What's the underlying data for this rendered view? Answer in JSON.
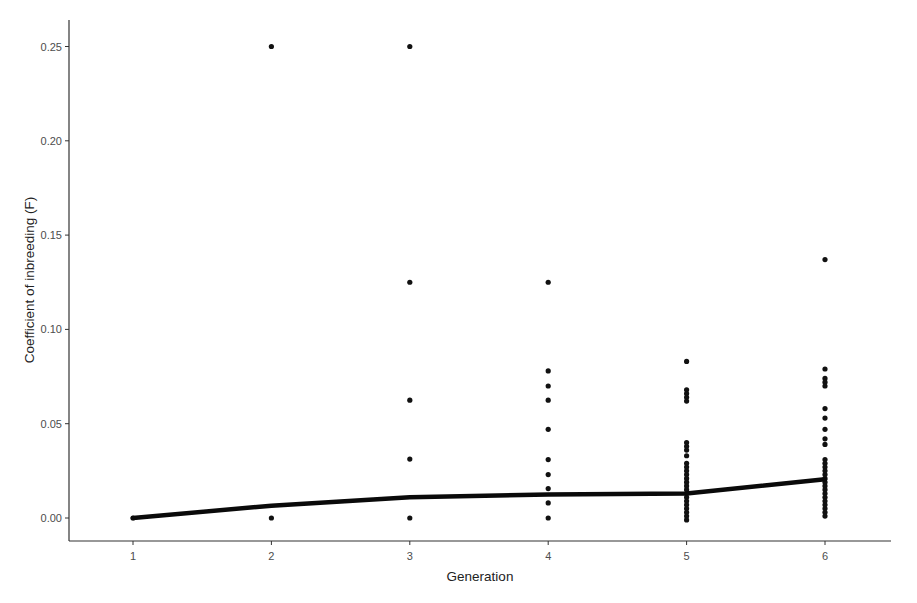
{
  "chart_data": {
    "type": "scatter",
    "title": "",
    "xlabel": "Generation",
    "ylabel": "Coefficient of inbreeding (F)",
    "x_ticks": [
      "1",
      "2",
      "3",
      "4",
      "5",
      "6"
    ],
    "y_ticks": [
      "0.00",
      "0.05",
      "0.10",
      "0.15",
      "0.20",
      "0.25"
    ],
    "xlim": [
      0.55,
      6.5
    ],
    "ylim": [
      -0.012,
      0.263
    ],
    "grid": false,
    "legend": null,
    "series": [
      {
        "name": "individuals",
        "kind": "points",
        "points": [
          {
            "x": 1,
            "y": 0.0
          },
          {
            "x": 2,
            "y": 0.25
          },
          {
            "x": 2,
            "y": 0.0
          },
          {
            "x": 3,
            "y": 0.25
          },
          {
            "x": 3,
            "y": 0.125
          },
          {
            "x": 3,
            "y": 0.0625
          },
          {
            "x": 3,
            "y": 0.03125
          },
          {
            "x": 3,
            "y": 0.0
          },
          {
            "x": 4,
            "y": 0.125
          },
          {
            "x": 4,
            "y": 0.078
          },
          {
            "x": 4,
            "y": 0.07
          },
          {
            "x": 4,
            "y": 0.0625
          },
          {
            "x": 4,
            "y": 0.047
          },
          {
            "x": 4,
            "y": 0.031
          },
          {
            "x": 4,
            "y": 0.023
          },
          {
            "x": 4,
            "y": 0.0156
          },
          {
            "x": 4,
            "y": 0.008
          },
          {
            "x": 4,
            "y": 0.0
          },
          {
            "x": 5,
            "y": 0.083
          },
          {
            "x": 5,
            "y": 0.068
          },
          {
            "x": 5,
            "y": 0.066
          },
          {
            "x": 5,
            "y": 0.064
          },
          {
            "x": 5,
            "y": 0.062
          },
          {
            "x": 5,
            "y": 0.04
          },
          {
            "x": 5,
            "y": 0.038
          },
          {
            "x": 5,
            "y": 0.036
          },
          {
            "x": 5,
            "y": 0.033
          },
          {
            "x": 5,
            "y": 0.029
          },
          {
            "x": 5,
            "y": 0.027
          },
          {
            "x": 5,
            "y": 0.025
          },
          {
            "x": 5,
            "y": 0.023
          },
          {
            "x": 5,
            "y": 0.021
          },
          {
            "x": 5,
            "y": 0.019
          },
          {
            "x": 5,
            "y": 0.017
          },
          {
            "x": 5,
            "y": 0.015
          },
          {
            "x": 5,
            "y": 0.013
          },
          {
            "x": 5,
            "y": 0.011
          },
          {
            "x": 5,
            "y": 0.009
          },
          {
            "x": 5,
            "y": 0.007
          },
          {
            "x": 5,
            "y": 0.005
          },
          {
            "x": 5,
            "y": 0.003
          },
          {
            "x": 5,
            "y": 0.001
          },
          {
            "x": 5,
            "y": -0.001
          },
          {
            "x": 6,
            "y": 0.137
          },
          {
            "x": 6,
            "y": 0.079
          },
          {
            "x": 6,
            "y": 0.074
          },
          {
            "x": 6,
            "y": 0.072
          },
          {
            "x": 6,
            "y": 0.07
          },
          {
            "x": 6,
            "y": 0.058
          },
          {
            "x": 6,
            "y": 0.053
          },
          {
            "x": 6,
            "y": 0.047
          },
          {
            "x": 6,
            "y": 0.042
          },
          {
            "x": 6,
            "y": 0.039
          },
          {
            "x": 6,
            "y": 0.031
          },
          {
            "x": 6,
            "y": 0.029
          },
          {
            "x": 6,
            "y": 0.027
          },
          {
            "x": 6,
            "y": 0.025
          },
          {
            "x": 6,
            "y": 0.023
          },
          {
            "x": 6,
            "y": 0.021
          },
          {
            "x": 6,
            "y": 0.019
          },
          {
            "x": 6,
            "y": 0.017
          },
          {
            "x": 6,
            "y": 0.015
          },
          {
            "x": 6,
            "y": 0.013
          },
          {
            "x": 6,
            "y": 0.011
          },
          {
            "x": 6,
            "y": 0.009
          },
          {
            "x": 6,
            "y": 0.007
          },
          {
            "x": 6,
            "y": 0.005
          },
          {
            "x": 6,
            "y": 0.003
          },
          {
            "x": 6,
            "y": 0.001
          }
        ]
      },
      {
        "name": "mean F (trend)",
        "kind": "line",
        "x": [
          1,
          2,
          3,
          4,
          5,
          6
        ],
        "y": [
          0.0,
          0.0065,
          0.011,
          0.0125,
          0.013,
          0.0205
        ]
      }
    ]
  }
}
